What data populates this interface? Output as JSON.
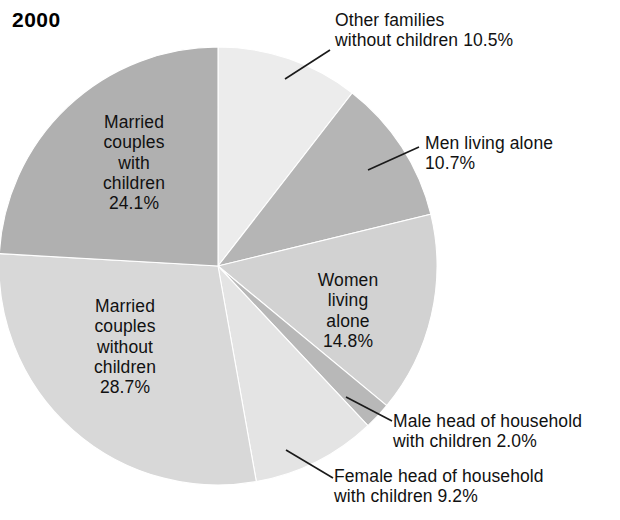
{
  "chart_data": {
    "type": "pie",
    "title": "2000",
    "subtitle": "",
    "xlabel": "",
    "ylabel": "",
    "legend_position": "none",
    "grid": false,
    "units": "percent",
    "start_angle_deg": 0,
    "direction": "clockwise",
    "categories": [
      "Other families without children",
      "Men living alone",
      "Women living alone",
      "Male head of household with children",
      "Female head of household with children",
      "Married couples without children",
      "Married couples with children"
    ],
    "values": [
      10.5,
      10.7,
      14.8,
      2.0,
      9.2,
      28.7,
      24.1
    ],
    "slices": [
      {
        "key": "other_families",
        "label": "Other families\nwithout children 10.5%",
        "name": "Other families without children",
        "value": 10.5,
        "value_text": "10.5%",
        "color": "#ececec",
        "label_placement": "outside"
      },
      {
        "key": "men_alone",
        "label": "Men living alone\n10.7%",
        "name": "Men living alone",
        "value": 10.7,
        "value_text": "10.7%",
        "color": "#b5b5b5",
        "label_placement": "outside"
      },
      {
        "key": "women_alone",
        "label": "Women\nliving\nalone\n14.8%",
        "name": "Women living alone",
        "value": 14.8,
        "value_text": "14.8%",
        "color": "#d2d2d2",
        "label_placement": "inside"
      },
      {
        "key": "male_head",
        "label": "Male head of household\nwith children 2.0%",
        "name": "Male head of household with children",
        "value": 2.0,
        "value_text": "2.0%",
        "color": "#b8b8b8",
        "label_placement": "outside"
      },
      {
        "key": "female_head",
        "label": "Female head of household\nwith children 9.2%",
        "name": "Female head of household with children",
        "value": 9.2,
        "value_text": "9.2%",
        "color": "#e4e4e4",
        "label_placement": "outside"
      },
      {
        "key": "married_without_children",
        "label": "Married\ncouples\nwithout\nchildren\n28.7%",
        "name": "Married couples without children",
        "value": 28.7,
        "value_text": "28.7%",
        "color": "#d8d8d8",
        "label_placement": "inside"
      },
      {
        "key": "married_with_children",
        "label": "Married\ncouples\nwith\nchildren\n24.1%",
        "name": "Married couples with children",
        "value": 24.1,
        "value_text": "24.1%",
        "color": "#b0b0b0",
        "label_placement": "inside"
      }
    ]
  },
  "colors": {
    "background": "#ffffff",
    "text": "#111111",
    "leader_line": "#1a1a1a"
  }
}
